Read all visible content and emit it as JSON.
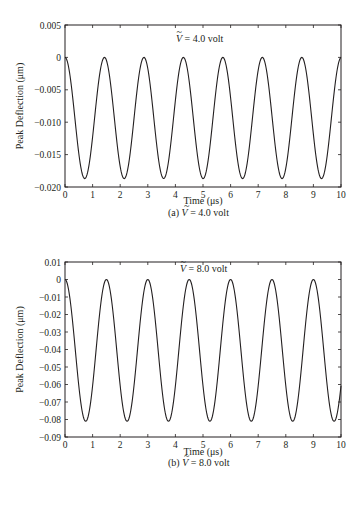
{
  "chart_data": [
    {
      "type": "line",
      "panel": "a",
      "caption_prefix": "(a)",
      "caption_var": "V",
      "caption_value": " = 4.0 volt",
      "annotation_var": "V",
      "annotation_value": " = 4.0 volt",
      "title": "",
      "xlabel": "Time (μs)",
      "ylabel": "Peak Deflection (μm)",
      "xlim": [
        0,
        10
      ],
      "ylim": [
        -0.02,
        0.005
      ],
      "xticks": [
        0,
        1,
        2,
        3,
        4,
        5,
        6,
        7,
        8,
        9,
        10
      ],
      "xtick_labels": [
        "0",
        "1",
        "2",
        "3",
        "4",
        "5",
        "6",
        "7",
        "8",
        "9",
        "10"
      ],
      "yticks": [
        0.005,
        0,
        -0.005,
        -0.01,
        -0.015,
        -0.02
      ],
      "ytick_labels": [
        "0.005",
        "0",
        "−0.005",
        "−0.010",
        "−0.015",
        "−0.020"
      ],
      "grid": false,
      "series": [
        {
          "name": "Peak deflection, V = 4.0 volt",
          "form": "A*(cos(2*pi*t/T)-1)/2",
          "amplitude_min": -0.0187,
          "period_us": 1.43,
          "peaks_x": [
            0,
            1.43,
            2.86,
            4.29,
            5.72,
            7.15,
            8.58,
            10.0
          ],
          "peaks_y": 0,
          "troughs_x": [
            0.72,
            2.15,
            3.58,
            5.0,
            6.44,
            7.87,
            9.3
          ],
          "troughs_y": -0.0187
        }
      ]
    },
    {
      "type": "line",
      "panel": "b",
      "caption_prefix": "(b)",
      "caption_var": "V",
      "caption_value": " = 8.0 volt",
      "annotation_var": "V",
      "annotation_value": " = 8.0 volt",
      "title": "",
      "xlabel": "Time (μs)",
      "ylabel": "Peak Deflection (μm)",
      "xlim": [
        0,
        10
      ],
      "ylim": [
        -0.09,
        0.01
      ],
      "xticks": [
        0,
        1,
        2,
        3,
        4,
        5,
        6,
        7,
        8,
        9,
        10
      ],
      "xtick_labels": [
        "0",
        "1",
        "2",
        "3",
        "4",
        "5",
        "6",
        "7",
        "8",
        "9",
        "10"
      ],
      "yticks": [
        0.01,
        0,
        -0.01,
        -0.02,
        -0.03,
        -0.04,
        -0.05,
        -0.06,
        -0.07,
        -0.08,
        -0.09
      ],
      "ytick_labels": [
        "0.01",
        "0",
        "−0.01",
        "−0.02",
        "−0.03",
        "−0.04",
        "−0.05",
        "−0.06",
        "−0.07",
        "−0.08",
        "−0.09"
      ],
      "grid": false,
      "series": [
        {
          "name": "Peak deflection, V = 8.0 volt",
          "form": "A*(cos(2*pi*t/T)-1)/2",
          "amplitude_min": -0.081,
          "period_us": 1.5,
          "peaks_x": [
            0,
            1.5,
            3.0,
            4.5,
            6.0,
            7.5,
            9.0
          ],
          "peaks_y": 0,
          "troughs_x": [
            0.75,
            2.25,
            3.75,
            5.25,
            6.75,
            8.25,
            9.75
          ],
          "troughs_y": -0.081
        }
      ]
    }
  ],
  "colors": {
    "line": "#231f20",
    "axis": "#231f20",
    "background": "#ffffff"
  }
}
